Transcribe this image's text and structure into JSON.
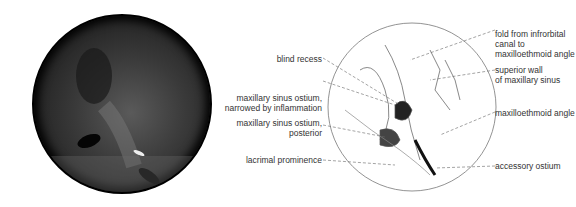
{
  "figure": {
    "photo": {
      "description": "endoscopic view of maxillary sinus region (grayscale)"
    },
    "labels_left": [
      {
        "id": "blind-recess",
        "lines": [
          "blind recess"
        ]
      },
      {
        "id": "maxillary-sinus-ostium-narrowed",
        "lines": [
          "maxillary sinus ostium,",
          "narrowed by inflammation"
        ]
      },
      {
        "id": "maxillary-sinus-ostium-posterior",
        "lines": [
          "maxillary sinus ostium,",
          "posterior"
        ]
      },
      {
        "id": "lacrimal-prominence",
        "lines": [
          "lacrimal prominence"
        ]
      }
    ],
    "labels_right": [
      {
        "id": "fold-from-infrorbital",
        "lines": [
          "fold from infrorbital",
          "canal to",
          "maxilloethmoid angle"
        ]
      },
      {
        "id": "superior-wall",
        "lines": [
          "superior wall",
          "of maxillary sinus"
        ]
      },
      {
        "id": "maxilloethmoid-angle",
        "lines": [
          "maxilloethmoid angle"
        ]
      },
      {
        "id": "accessory-ostium",
        "lines": [
          "accessory ostium"
        ]
      }
    ]
  }
}
